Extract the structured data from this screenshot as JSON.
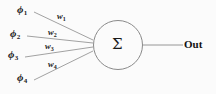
{
  "diagram": {
    "type": "neural-network-neuron",
    "background_color": "#fbfbfb",
    "line_color": "#8a8a8a",
    "text_color": "#1a1a1a"
  },
  "inputs": [
    {
      "symbol": "ϕ",
      "subscript": "1",
      "label": "ϕ1"
    },
    {
      "symbol": "ϕ",
      "subscript": "2",
      "label": "ϕ2"
    },
    {
      "symbol": "ϕ",
      "subscript": "3",
      "label": "ϕ3"
    },
    {
      "symbol": "ϕ",
      "subscript": "4",
      "label": "ϕ4"
    }
  ],
  "weights": [
    {
      "symbol": "w",
      "subscript": "1",
      "label": "w1"
    },
    {
      "symbol": "w",
      "subscript": "2",
      "label": "w2"
    },
    {
      "symbol": "w",
      "subscript": "3",
      "label": "w3"
    },
    {
      "symbol": "w",
      "subscript": "4",
      "label": "w4"
    }
  ],
  "node": {
    "symbol": "Σ",
    "name": "summation-node"
  },
  "output": {
    "label": "Out"
  },
  "geometry": {
    "node": {
      "cx": 118,
      "cy": 45,
      "r": 25
    },
    "junction": {
      "x": 93.5,
      "y": 45
    },
    "edges": [
      {
        "x1": 34,
        "y1": 12,
        "x2": 93,
        "y2": 40
      },
      {
        "x1": 27,
        "y1": 36,
        "x2": 93,
        "y2": 43
      },
      {
        "x1": 25,
        "y1": 57,
        "x2": 93,
        "y2": 47
      },
      {
        "x1": 34,
        "y1": 80,
        "x2": 93,
        "y2": 51
      }
    ],
    "output_edge": {
      "x1": 143,
      "y1": 45,
      "x2": 183,
      "y2": 45
    }
  }
}
